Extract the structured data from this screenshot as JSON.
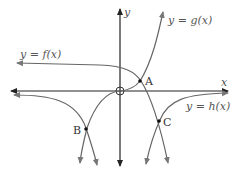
{
  "diagram": {
    "axes": {
      "x_label": "x",
      "y_label": "y",
      "origin_marker": "circle"
    },
    "curves": [
      {
        "name": "f",
        "label": "y = f(x)"
      },
      {
        "name": "g",
        "label": "y = g(x)"
      },
      {
        "name": "h",
        "label": "y = h(x)"
      }
    ],
    "points": [
      {
        "label": "A"
      },
      {
        "label": "B"
      },
      {
        "label": "C"
      }
    ],
    "colors": {
      "axis": "#222222",
      "curve": "#666666",
      "text": "#555555"
    }
  }
}
